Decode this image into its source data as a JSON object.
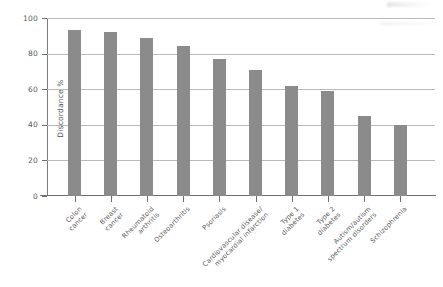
{
  "chart_data": {
    "type": "bar",
    "title": "",
    "xlabel": "",
    "ylabel": "Discordance %",
    "ylim": [
      0,
      100
    ],
    "yticks": [
      0,
      20,
      40,
      60,
      80,
      100
    ],
    "grid": true,
    "legend": "none",
    "bar_color": "#8b8b8b",
    "gridline_color": "#b9b9b9",
    "axis_color": "#6f6f6f",
    "label_rotation": -45,
    "categories": [
      "Colon cancer",
      "Breast cancer",
      "Rheumatoid arthritis",
      "Osteoarthritis",
      "Psoriasis",
      "Cardiovascular disease/ myocardial infarction",
      "Type 1 diabetes",
      "Type 2 diabetes",
      "Autism/autism spectrum disorders",
      "Schizophrenia"
    ],
    "category_lines": [
      [
        "Colon",
        "cancer"
      ],
      [
        "Breast",
        "cancer"
      ],
      [
        "Rheumatoid",
        "arthritis"
      ],
      [
        "Osteoarthritis"
      ],
      [
        "Psoriasis"
      ],
      [
        "Cardiovascular disease/",
        "myocardial infarction"
      ],
      [
        "Type 1",
        "diabetes"
      ],
      [
        "Type 2",
        "diabetes"
      ],
      [
        "Autism/autism",
        "spectrum disorders"
      ],
      [
        "Schizophrenia"
      ]
    ],
    "values": [
      93,
      92,
      89,
      84,
      77,
      71,
      62,
      59,
      45,
      40
    ]
  }
}
